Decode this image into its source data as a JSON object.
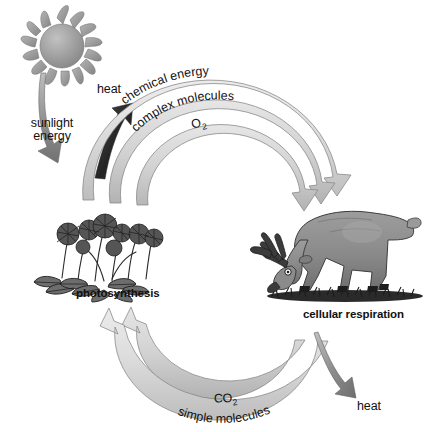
{
  "diagram": {
    "background_color": "#ffffff",
    "arc_band_color": "#d6d6d6",
    "arc_band_edge_color": "#8a8a8a",
    "dark_arrow_color": "#2e2e2e",
    "gray_arrow_color": "#8f8f8f",
    "text_color": "#111111"
  },
  "nodes": {
    "sun": {
      "name": "sun",
      "icon": "sun-icon",
      "ray_count": 16,
      "disc_color": "#9a9a9a"
    },
    "plant": {
      "name": "plant",
      "icon": "flowering-plant-icon",
      "label": "photosynthesis"
    },
    "animal": {
      "name": "animal",
      "icon": "grazing-deer-icon",
      "label": "cellular respiration"
    }
  },
  "flows": {
    "sunlight": {
      "label_line1": "sunlight",
      "label_line2": "energy",
      "direction": "sun-to-plant",
      "arrow_style": "gray"
    },
    "heat_top": {
      "label": "heat",
      "direction": "up",
      "arrow_style": "dark"
    },
    "heat_bottom": {
      "label": "heat",
      "direction": "down",
      "arrow_style": "gray"
    },
    "top_arcs": [
      {
        "label": "chemical energy",
        "position": "outer",
        "direction": "plant-to-animal"
      },
      {
        "label": "complex molecules",
        "position": "middle",
        "direction": "plant-to-animal"
      },
      {
        "label": "O",
        "sub": "2",
        "position": "inner",
        "direction": "plant-to-animal"
      }
    ],
    "bottom_arcs": [
      {
        "label": "CO",
        "sub": "2",
        "position": "inner",
        "direction": "animal-to-plant"
      },
      {
        "label": "simple molecules",
        "position": "outer",
        "direction": "animal-to-plant"
      }
    ]
  },
  "labels": {
    "photosynthesis": "photosynthesis",
    "cellular_respiration": "cellular respiration",
    "heat_top": "heat",
    "heat_bottom": "heat",
    "sunlight_line1": "sunlight",
    "sunlight_line2": "energy",
    "chemical_energy": "chemical energy",
    "complex_molecules": "complex molecules",
    "o2_base": "O",
    "o2_sub": "2",
    "co2_base": "CO",
    "co2_sub": "2",
    "simple_molecules": "simple molecules"
  }
}
